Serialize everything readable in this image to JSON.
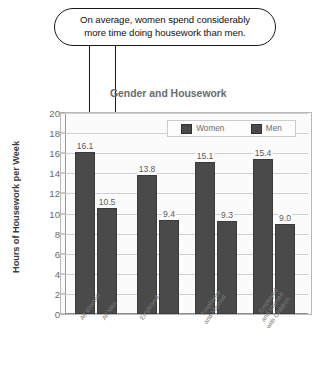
{
  "callout": {
    "line1": "On average, women spend considerably",
    "line2": "more time doing housework than men.",
    "arrow_women_name": "arrow-to-all-women-bar",
    "arrow_men_name": "arrow-to-all-men-bar"
  },
  "chart_data": {
    "type": "bar",
    "title": "Gender and Housework",
    "xlabel": "",
    "ylabel": "Hours of Housework per Week",
    "ylim": [
      0,
      20
    ],
    "ytick_step": 2,
    "yticks": [
      "20",
      "18",
      "16",
      "14",
      "12",
      "10",
      "8",
      "6",
      "4",
      "2",
      "0"
    ],
    "grid": true,
    "legend_position": "top-right",
    "categories": [
      "All Women",
      "All Men",
      "Employed",
      "Employed and Married",
      "Employed and Married with Children"
    ],
    "category_lines": [
      [
        "All Women"
      ],
      [
        "All Men"
      ],
      [
        "Employed"
      ],
      [
        "Employed",
        "and Married"
      ],
      [
        "Employed",
        "and Married",
        "with Children"
      ]
    ],
    "series": [
      {
        "name": "Women",
        "color": "#4a4a4a",
        "values": [
          16.1,
          null,
          13.8,
          15.1,
          15.4
        ]
      },
      {
        "name": "Men",
        "color": "#4a4a4a",
        "values": [
          null,
          10.5,
          9.4,
          9.3,
          9.0
        ]
      }
    ],
    "bars": [
      {
        "label": "16.1",
        "value": 16.1,
        "series": "Women",
        "category": "All Women"
      },
      {
        "label": "10.5",
        "value": 10.5,
        "series": "Men",
        "category": "All Men"
      },
      {
        "label": "13.8",
        "value": 13.8,
        "series": "Women",
        "category": "Employed"
      },
      {
        "label": "9.4",
        "value": 9.4,
        "series": "Men",
        "category": "Employed"
      },
      {
        "label": "15.1",
        "value": 15.1,
        "series": "Women",
        "category": "Employed and Married"
      },
      {
        "label": "9.3",
        "value": 9.3,
        "series": "Men",
        "category": "Employed and Married"
      },
      {
        "label": "15.4",
        "value": 15.4,
        "series": "Women",
        "category": "Employed and Married with Children"
      },
      {
        "label": "9.0",
        "value": 9.0,
        "series": "Men",
        "category": "Employed and Married with Children"
      }
    ],
    "legend": [
      {
        "label": "Women",
        "color": "#4a4a4a"
      },
      {
        "label": "Men",
        "color": "#4a4a4a"
      }
    ]
  }
}
